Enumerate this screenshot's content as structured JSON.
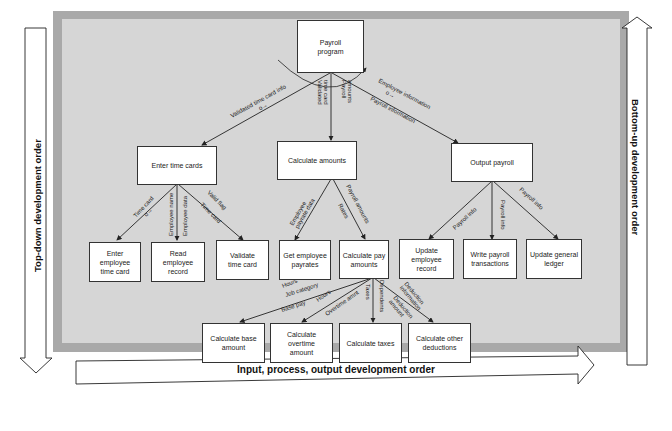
{
  "diagram": {
    "nodes": {
      "root": "Payroll\nprogram",
      "enter_time_cards": "Enter time cards",
      "calculate_amounts": "Calculate amounts",
      "output_payroll": "Output payroll",
      "enter_employee_time_card": "Enter employee\ntime card",
      "read_employee_record": "Read employee\nrecord",
      "validate_time_card": "Validate\ntime card",
      "get_employee_payrates": "Get employee\npayrates",
      "calculate_pay_amounts": "Calculate pay\namounts",
      "update_employee_record": "Update employee\nrecord",
      "write_payroll_transactions": "Write payroll\ntransactions",
      "update_general_ledger": "Update general\nledger",
      "calculate_base_amount": "Calculate base\namount",
      "calculate_overtime_amount": "Calculate overtime\namount",
      "calculate_taxes": "Calculate taxes",
      "calculate_other_deductions": "Calculate other\ndeductions"
    },
    "flows": {
      "validated_time_card_info": "Validated time card info",
      "validated_time_card_1": "Validated",
      "validated_time_card_2": "time card",
      "payroll_amounts_1": "Payroll",
      "payroll_amounts_2": "amounts",
      "employee_information": "Employee information",
      "payroll_information": "Payroll information",
      "time_card": "Time card",
      "employee_name": "Employee name",
      "employee_data": "Employee data",
      "valid_flag": "Valid flag",
      "time_card_2": "Time card",
      "employee_payrate_data_1": "Employee",
      "employee_payrate_data_2": "payrate data",
      "payroll_amounts_3": "Payroll amounts",
      "rates": "Rates",
      "payroll_info_1": "Payroll info",
      "payroll_info_2": "Payroll info",
      "payroll_info_3": "Payroll info",
      "hours_1": "Hours",
      "job_category": "Job category",
      "base_pay": "Base pay",
      "hours_2": "Hours",
      "overtime_amnt": "Overtime amnt",
      "taxes": "Taxes",
      "dependents": "Dependents",
      "deduction_information_1": "Deduction",
      "deduction_information_2": "information",
      "deduction_amount_1": "Deduction",
      "deduction_amount_2": "amount"
    },
    "orders": {
      "top_down": "Top-down development order",
      "bottom_up": "Bottom-up development order",
      "ipo": "Input, process, output development order"
    },
    "colors": {
      "frame_outer": "#a9a9a9",
      "frame_inner": "#d6d6d6",
      "node_fill": "#ffffff",
      "line": "#222222"
    }
  }
}
